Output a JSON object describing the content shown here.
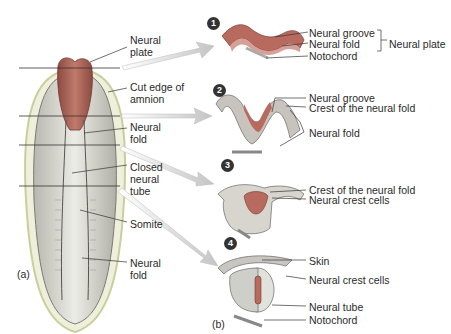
{
  "panel_a": {
    "label": "(a)",
    "labels": {
      "neural_plate": "Neural\nplate",
      "cut_edge_amnion": "Cut edge of\namnion",
      "neural_fold": "Neural\nfold",
      "closed_neural_tube": "Closed\nneural\ntube",
      "somite": "Somite",
      "neural_fold_lower": "Neural\nfold"
    }
  },
  "panel_b": {
    "label": "(b)",
    "steps": [
      {
        "number": "1",
        "labels": [
          "Neural groove",
          "Neural fold",
          "Notochord"
        ],
        "bracket_label": "Neural plate"
      },
      {
        "number": "2",
        "labels": [
          "Neural groove",
          "Crest of the neural fold",
          "Neural fold"
        ]
      },
      {
        "number": "3",
        "labels": [
          "Crest of the neural fold",
          "Neural crest cells"
        ]
      },
      {
        "number": "4",
        "labels": [
          "Skin",
          "Neural crest cells",
          "Neural tube",
          "Notochord"
        ]
      }
    ]
  },
  "colors": {
    "neural_tissue": "#b86a5e",
    "neural_tissue_dark": "#8e4a42",
    "embryo_body": "#dcdcd4",
    "amnion_outline": "#c9cf9a",
    "arrow": "#cfcfcf"
  }
}
